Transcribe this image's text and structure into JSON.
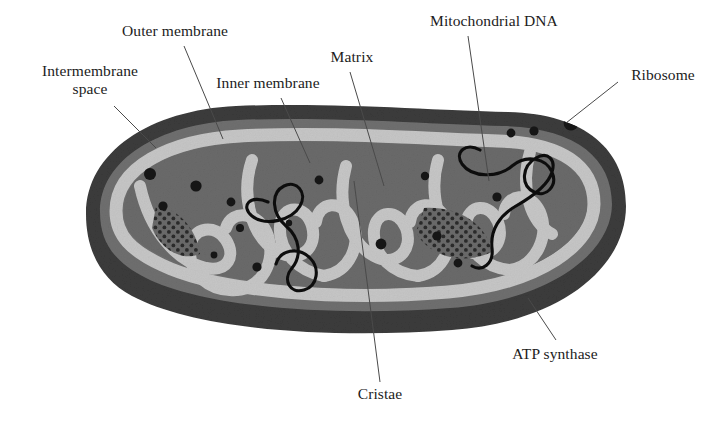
{
  "figure": {
    "background_color": "#ffffff",
    "style": "grayscale textbook illustration"
  },
  "palette": {
    "outer_membrane_dark": "#3b3b3b",
    "intermembrane_mid": "#6f6f6f",
    "membrane_light": "#c6c6c6",
    "matrix_mid": "#6a6a6a",
    "ribosome_black": "#141414",
    "dna_black": "#0f0f0f",
    "leader_line": "#4a4a4a",
    "text": "#1c1c1c"
  },
  "labels": [
    {
      "id": "outer-membrane",
      "text": "Outer membrane",
      "x": 175,
      "y": 22,
      "align": "center",
      "leader": {
        "x1": 184,
        "y1": 46,
        "x2": 223,
        "y2": 139
      }
    },
    {
      "id": "intermembrane-space",
      "text": "Intermembrane\nspace",
      "x": 90,
      "y": 62,
      "align": "center",
      "leader": {
        "x1": 114,
        "y1": 106,
        "x2": 156,
        "y2": 148
      }
    },
    {
      "id": "inner-membrane",
      "text": "Inner membrane",
      "x": 268,
      "y": 74,
      "align": "center",
      "leader": {
        "x1": 281,
        "y1": 98,
        "x2": 310,
        "y2": 163
      }
    },
    {
      "id": "matrix",
      "text": "Matrix",
      "x": 352,
      "y": 48,
      "align": "center",
      "leader": {
        "x1": 350,
        "y1": 72,
        "x2": 384,
        "y2": 186
      }
    },
    {
      "id": "mitochondrial-dna",
      "text": "Mitochondrial DNA",
      "x": 494,
      "y": 12,
      "align": "center",
      "leader": {
        "x1": 468,
        "y1": 36,
        "x2": 489,
        "y2": 181
      }
    },
    {
      "id": "ribosome",
      "text": "Ribosome",
      "x": 663,
      "y": 66,
      "align": "center",
      "leader": {
        "x1": 618,
        "y1": 82,
        "x2": 566,
        "y2": 123
      }
    },
    {
      "id": "atp-synthase",
      "text": "ATP synthase",
      "x": 555,
      "y": 345,
      "align": "center",
      "leader": {
        "x1": 556,
        "y1": 340,
        "x2": 528,
        "y2": 298
      }
    },
    {
      "id": "cristae",
      "text": "Cristae",
      "x": 380,
      "y": 385,
      "align": "center",
      "leader": {
        "x1": 380,
        "y1": 382,
        "x2": 354,
        "y2": 181
      }
    }
  ],
  "ribosomes": [
    {
      "cx": 150,
      "cy": 174,
      "r": 6.0
    },
    {
      "cx": 196,
      "cy": 186,
      "r": 5.6
    },
    {
      "cx": 163,
      "cy": 206,
      "r": 4.6
    },
    {
      "cx": 231,
      "cy": 202,
      "r": 4.4
    },
    {
      "cx": 240,
      "cy": 228,
      "r": 4.0
    },
    {
      "cx": 257,
      "cy": 267,
      "r": 4.6
    },
    {
      "cx": 214,
      "cy": 255,
      "r": 3.4
    },
    {
      "cx": 319,
      "cy": 180,
      "r": 4.4
    },
    {
      "cx": 381,
      "cy": 244,
      "r": 5.4
    },
    {
      "cx": 425,
      "cy": 176,
      "r": 4.2
    },
    {
      "cx": 437,
      "cy": 236,
      "r": 4.6
    },
    {
      "cx": 458,
      "cy": 263,
      "r": 4.4
    },
    {
      "cx": 511,
      "cy": 133,
      "r": 4.4
    },
    {
      "cx": 534,
      "cy": 131,
      "r": 4.6
    },
    {
      "cx": 571,
      "cy": 123,
      "r": 7.4
    },
    {
      "cx": 497,
      "cy": 197,
      "r": 4.6
    },
    {
      "cx": 289,
      "cy": 223,
      "r": 3.2
    }
  ],
  "stipple_patches": [
    {
      "id": "atp-patch-left",
      "cx": 176,
      "cy": 228
    },
    {
      "id": "atp-patch-right",
      "cx": 455,
      "cy": 232
    }
  ],
  "counts": {
    "ribosomes_drawn": 17,
    "dna_strands": 2,
    "cristae_folds": 9
  }
}
